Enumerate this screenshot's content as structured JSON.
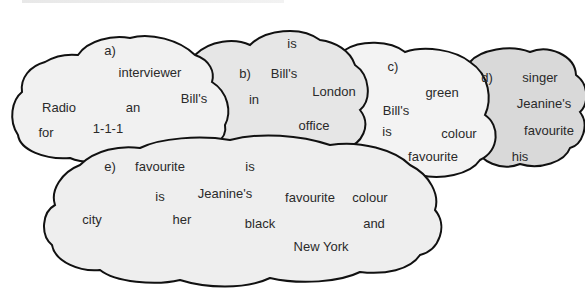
{
  "exercise": {
    "instruction_cropped": "",
    "clouds": [
      {
        "id": "a",
        "label": "a)",
        "fill": "#f1f1f1",
        "words": [
          {
            "text": "interviewer",
            "x": 150,
            "y": 72
          },
          {
            "text": "Bill's",
            "x": 194,
            "y": 98
          },
          {
            "text": "Radio",
            "x": 59,
            "y": 107
          },
          {
            "text": "an",
            "x": 133,
            "y": 107
          },
          {
            "text": "for",
            "x": 46,
            "y": 132
          },
          {
            "text": "1-1-1",
            "x": 108,
            "y": 128
          }
        ],
        "label_pos": {
          "x": 110,
          "y": 50
        }
      },
      {
        "id": "b",
        "label": "b)",
        "fill": "#e6e6e6",
        "words": [
          {
            "text": "is",
            "x": 292,
            "y": 43
          },
          {
            "text": "Bill's",
            "x": 284,
            "y": 73
          },
          {
            "text": "London",
            "x": 334,
            "y": 91
          },
          {
            "text": "in",
            "x": 254,
            "y": 99
          },
          {
            "text": "office",
            "x": 314,
            "y": 125
          }
        ],
        "label_pos": {
          "x": 245,
          "y": 73
        }
      },
      {
        "id": "c",
        "label": "c)",
        "fill": "#f3f3f3",
        "words": [
          {
            "text": "green",
            "x": 442,
            "y": 92
          },
          {
            "text": "Bill's",
            "x": 396,
            "y": 110
          },
          {
            "text": "is",
            "x": 387,
            "y": 131
          },
          {
            "text": "colour",
            "x": 459,
            "y": 133
          },
          {
            "text": "favourite",
            "x": 433,
            "y": 156
          }
        ],
        "label_pos": {
          "x": 393,
          "y": 66
        }
      },
      {
        "id": "d",
        "label": "d)",
        "fill": "#d9d9d9",
        "words": [
          {
            "text": "singer",
            "x": 540,
            "y": 77
          },
          {
            "text": "Jeanine's",
            "x": 544,
            "y": 103
          },
          {
            "text": "favourite",
            "x": 549,
            "y": 130
          },
          {
            "text": "his",
            "x": 520,
            "y": 156
          }
        ],
        "label_pos": {
          "x": 487,
          "y": 77
        }
      },
      {
        "id": "e",
        "label": "e)",
        "fill": "#eeeeee",
        "words": [
          {
            "text": "favourite",
            "x": 160,
            "y": 166
          },
          {
            "text": "is",
            "x": 250,
            "y": 166
          },
          {
            "text": "is",
            "x": 160,
            "y": 196
          },
          {
            "text": "Jeanine's",
            "x": 225,
            "y": 193
          },
          {
            "text": "favourite",
            "x": 310,
            "y": 197
          },
          {
            "text": "colour",
            "x": 370,
            "y": 197
          },
          {
            "text": "city",
            "x": 92,
            "y": 219
          },
          {
            "text": "her",
            "x": 182,
            "y": 219
          },
          {
            "text": "black",
            "x": 260,
            "y": 223
          },
          {
            "text": "and",
            "x": 374,
            "y": 223
          },
          {
            "text": "New York",
            "x": 321,
            "y": 246
          }
        ],
        "label_pos": {
          "x": 110,
          "y": 166
        }
      }
    ]
  },
  "colors": {
    "outline": "#111111",
    "text": "#2a2a2a",
    "background": "#ffffff"
  }
}
